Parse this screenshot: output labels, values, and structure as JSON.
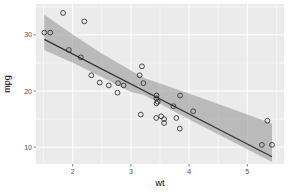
{
  "chart_data": {
    "type": "scatter",
    "title": "",
    "xlabel": "wt",
    "ylabel": "mpg",
    "xlim": [
      1.37,
      5.63
    ],
    "ylim": [
      7.0,
      35.5
    ],
    "x_ticks": [
      2,
      3,
      4,
      5
    ],
    "y_ticks": [
      10,
      20,
      30
    ],
    "grid": true,
    "legend": "none",
    "colors": {
      "panel_bg": "#ebebeb",
      "grid": "#ffffff",
      "points": "#333333",
      "ribbon": "#999999",
      "line": "#333333"
    },
    "points": [
      {
        "x": 2.62,
        "y": 21.0
      },
      {
        "x": 2.875,
        "y": 21.0
      },
      {
        "x": 2.32,
        "y": 22.8
      },
      {
        "x": 3.215,
        "y": 21.4
      },
      {
        "x": 3.44,
        "y": 18.7
      },
      {
        "x": 3.46,
        "y": 18.1
      },
      {
        "x": 3.57,
        "y": 14.3
      },
      {
        "x": 3.19,
        "y": 24.4
      },
      {
        "x": 3.15,
        "y": 22.8
      },
      {
        "x": 3.44,
        "y": 19.2
      },
      {
        "x": 3.44,
        "y": 17.8
      },
      {
        "x": 4.07,
        "y": 16.4
      },
      {
        "x": 3.73,
        "y": 17.3
      },
      {
        "x": 3.78,
        "y": 15.2
      },
      {
        "x": 5.25,
        "y": 10.4
      },
      {
        "x": 5.424,
        "y": 10.4
      },
      {
        "x": 5.345,
        "y": 14.7
      },
      {
        "x": 2.2,
        "y": 32.4
      },
      {
        "x": 1.615,
        "y": 30.4
      },
      {
        "x": 1.835,
        "y": 33.9
      },
      {
        "x": 2.465,
        "y": 21.5
      },
      {
        "x": 3.52,
        "y": 15.5
      },
      {
        "x": 3.435,
        "y": 15.2
      },
      {
        "x": 3.84,
        "y": 13.3
      },
      {
        "x": 3.845,
        "y": 19.2
      },
      {
        "x": 1.935,
        "y": 27.3
      },
      {
        "x": 2.14,
        "y": 26.0
      },
      {
        "x": 1.513,
        "y": 30.4
      },
      {
        "x": 3.17,
        "y": 15.8
      },
      {
        "x": 2.77,
        "y": 19.7
      },
      {
        "x": 3.57,
        "y": 15.0
      },
      {
        "x": 2.78,
        "y": 21.4
      }
    ],
    "smooth": {
      "method": "lm",
      "intercept": 37.285,
      "slope": -5.344,
      "x_range": [
        1.513,
        5.424
      ],
      "ribbon": {
        "x": [
          1.513,
          2.0,
          2.5,
          3.0,
          3.217,
          3.5,
          4.0,
          4.5,
          5.0,
          5.424
        ],
        "lower": [
          27.28,
          25.02,
          22.52,
          19.85,
          19.34,
          17.72,
          14.98,
          12.31,
          9.62,
          7.35
        ],
        "upper": [
          33.59,
          30.06,
          26.69,
          23.63,
          22.35,
          21.34,
          19.56,
          17.7,
          15.81,
          14.21
        ]
      }
    }
  }
}
